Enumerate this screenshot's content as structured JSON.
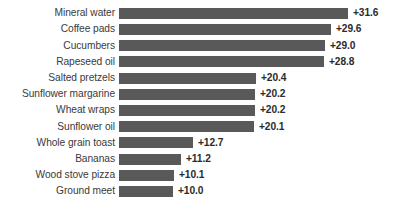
{
  "chart_data": {
    "type": "bar",
    "orientation": "horizontal",
    "title": "",
    "subtitle": "",
    "xlabel": "",
    "ylabel": "",
    "grid": false,
    "legend": false,
    "axis_visible": false,
    "value_prefix": "+",
    "bar_color": "#595959",
    "label_color": "#3a3a3a",
    "value_color": "#2b2b2b",
    "background": "#ffffff",
    "categories": [
      "Mineral water",
      "Coffee pads",
      "Cucumbers",
      "Rapeseed oil",
      "Salted pretzels",
      "Sunflower margarine",
      "Wheat wraps",
      "Sunflower oil",
      "Whole grain toast",
      "Bananas",
      "Wood stove pizza",
      "Ground meet"
    ],
    "values": [
      31.6,
      29.6,
      29.0,
      28.8,
      20.4,
      20.2,
      20.2,
      20.1,
      12.7,
      11.2,
      10.1,
      10.0
    ],
    "value_labels": [
      "+31.6",
      "+29.6",
      "+29.0",
      "+28.8",
      "+20.4",
      "+20.2",
      "+20.2",
      "+20.1",
      "+12.7",
      "+11.2",
      "+10.1",
      "+10.0"
    ],
    "bar_pixel_widths": [
      229,
      212,
      206,
      205,
      137,
      136,
      136,
      135,
      74,
      62,
      55,
      54
    ],
    "ylim": [
      0,
      12
    ],
    "xlim": [
      0,
      31.6
    ]
  }
}
